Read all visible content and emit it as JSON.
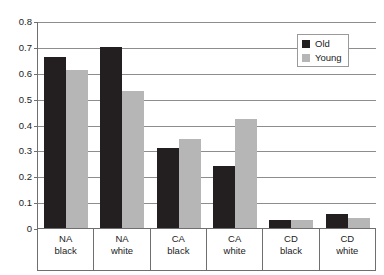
{
  "chart_data": {
    "type": "bar",
    "title": "",
    "xlabel": "",
    "ylabel": "",
    "ylim": [
      0,
      0.8
    ],
    "ytick_labels": [
      "0.8",
      "0.7",
      "0.6",
      "0.5",
      "0.4",
      "0.3",
      "0.2",
      "0.1",
      "0"
    ],
    "yticks": [
      0.8,
      0.7,
      0.6,
      0.5,
      0.4,
      0.3,
      0.2,
      0.1,
      0
    ],
    "grid": true,
    "legend_position": "top-right",
    "categories": [
      {
        "line1": "NA",
        "line2": "black"
      },
      {
        "line1": "NA",
        "line2": "white"
      },
      {
        "line1": "CA",
        "line2": "black"
      },
      {
        "line1": "CA",
        "line2": "white"
      },
      {
        "line1": "CD",
        "line2": "black"
      },
      {
        "line1": "CD",
        "line2": "white"
      }
    ],
    "series": [
      {
        "name": "Old",
        "color": "#231f20",
        "values": [
          0.66,
          0.7,
          0.31,
          0.24,
          0.03,
          0.055
        ]
      },
      {
        "name": "Young",
        "color": "#b6b6b6",
        "values": [
          0.61,
          0.53,
          0.345,
          0.42,
          0.03,
          0.04
        ]
      }
    ]
  },
  "legend": {
    "items": [
      {
        "label": "Old",
        "swatch": "swatch-old"
      },
      {
        "label": "Young",
        "swatch": "swatch-young"
      }
    ]
  },
  "caption": {
    "text": ""
  }
}
